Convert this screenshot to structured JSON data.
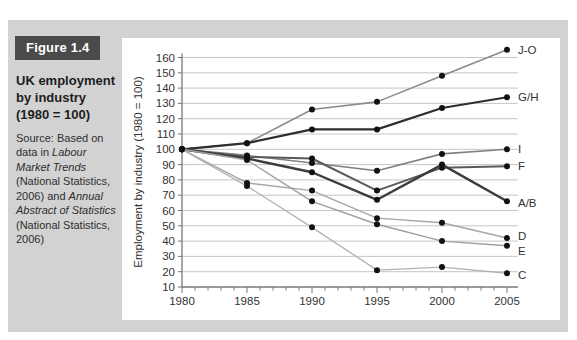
{
  "figure": {
    "tag": "Figure 1.4",
    "title": "UK employment by industry (1980 = 100)",
    "source_segments": [
      {
        "text": "Source: Based on data in ",
        "italic": false
      },
      {
        "text": "Labour Market Trends",
        "italic": true
      },
      {
        "text": " (National Statistics, 2006) and ",
        "italic": false
      },
      {
        "text": "Annual Abstract of Statistics",
        "italic": true
      },
      {
        "text": " (National Statistics, 2006)",
        "italic": false
      }
    ]
  },
  "chart_data": {
    "type": "line",
    "title": "",
    "xlabel": "",
    "ylabel": "Employment by industry (1980 = 100)",
    "x": [
      1980,
      1985,
      1990,
      1995,
      2000,
      2005
    ],
    "xlim": [
      1980,
      2005
    ],
    "ylim": [
      10,
      160
    ],
    "ytick_step": 10,
    "minor_xticks_every_year": true,
    "grid": true,
    "legend_position": "right-end-labels",
    "point_color": "#111111",
    "grid_color": "#c6c6c6",
    "axis_color": "#777777",
    "tick_label_color": "#333333",
    "series": [
      {
        "name": "J-O",
        "values": [
          100,
          104,
          126,
          131,
          148,
          165
        ],
        "color": "#8c8c8c",
        "width": 1.6,
        "label_dy": 0
      },
      {
        "name": "G/H",
        "values": [
          100,
          104,
          113,
          113,
          127,
          134
        ],
        "color": "#2e2e2e",
        "width": 2.2,
        "label_dy": 0
      },
      {
        "name": "I",
        "values": [
          100,
          96,
          91,
          86,
          97,
          100
        ],
        "color": "#808080",
        "width": 1.6,
        "label_dy": 0
      },
      {
        "name": "F",
        "values": [
          100,
          95,
          94,
          73,
          88,
          89
        ],
        "color": "#5a5a5a",
        "width": 2.0,
        "label_dy": 0
      },
      {
        "name": "A/B",
        "values": [
          100,
          94,
          85,
          67,
          90,
          66
        ],
        "color": "#3c3c3c",
        "width": 2.4,
        "label_dy": 2
      },
      {
        "name": "D",
        "values": [
          100,
          78,
          73,
          55,
          52,
          42
        ],
        "color": "#a6a6a6",
        "width": 1.4,
        "label_dy": -2
      },
      {
        "name": "E",
        "values": [
          100,
          93,
          66,
          51,
          40,
          37
        ],
        "color": "#9e9e9e",
        "width": 1.4,
        "label_dy": 5
      },
      {
        "name": "C",
        "values": [
          100,
          76,
          49,
          21,
          23,
          19
        ],
        "color": "#b4b4b4",
        "width": 1.4,
        "label_dy": 2
      }
    ]
  }
}
